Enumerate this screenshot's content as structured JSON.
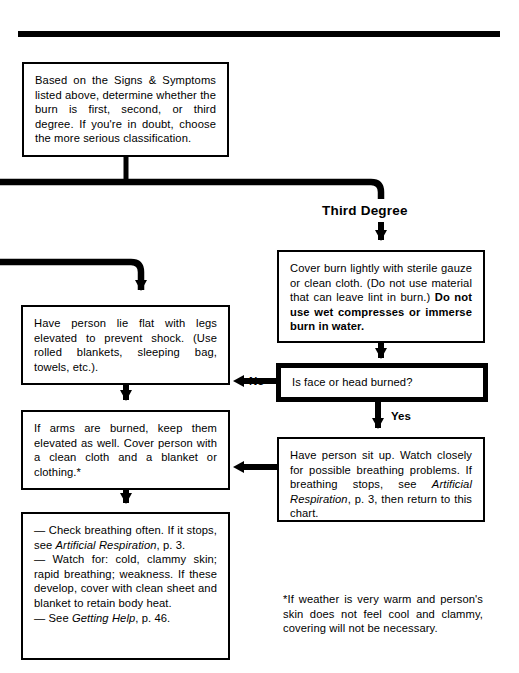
{
  "page": {
    "width": 519,
    "height": 673,
    "ink_color": "#000000",
    "paper_color": "#ffffff"
  },
  "rule": {
    "name": "top-rule"
  },
  "branch": {
    "third_degree_label": "Third Degree"
  },
  "edges": {
    "no_label": "No",
    "yes_label": "Yes"
  },
  "nodes": {
    "assess": {
      "text": "Based on the Signs & Symptoms listed above, determine whether the burn is first, second, or third degree. If you're in doubt, choose the more serious classification."
    },
    "cover_burn": {
      "plain_1": "Cover burn lightly with sterile gauze or clean cloth. (Do not use material that can leave lint in burn.) ",
      "bold_1": "Do not use wet compresses or immerse burn in water."
    },
    "face_head_question": {
      "text": "Is face or head burned?"
    },
    "lie_flat": {
      "text": "Have person lie flat with legs elevated to prevent shock. (Use rolled blankets, sleeping bag, towels, etc.)."
    },
    "arms_burned": {
      "text": "If arms are burned, keep them elevated as well. Cover person with a clean cloth and a blanket or clothing.*"
    },
    "sit_up": {
      "plain_1": "Have person sit up. Watch closely for possible breathing problems. If breathing stops, see ",
      "italic_1": "Artificial Respiration",
      "plain_2": ", p. 3, then return to this chart."
    },
    "monitor": {
      "line1_plain_1": "— Check breathing often. If it stops, see ",
      "line1_italic_1": "Artificial Respiration",
      "line1_plain_2": ", p. 3.",
      "line2_plain_1": "— Watch for: cold, clammy skin; rapid breathing; weakness. If these develop, cover with clean sheet and blanket to retain body heat.",
      "line3_plain_1": "— See ",
      "line3_italic_1": "Getting Help",
      "line3_plain_2": ", p. 46."
    }
  },
  "footnote": {
    "text": "*If weather is very warm and person's skin does not feel cool and clammy, covering will not be necessary."
  }
}
